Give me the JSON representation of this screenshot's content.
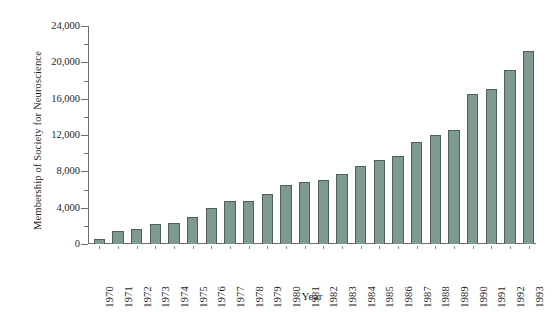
{
  "chart_data": {
    "type": "bar",
    "title": "",
    "xlabel": "Year",
    "ylabel": "Membership of Society for Neuroscience",
    "categories": [
      "1970",
      "1971",
      "1972",
      "1973",
      "1974",
      "1975",
      "1976",
      "1977",
      "1978",
      "1979",
      "1980",
      "1981",
      "1982",
      "1983",
      "1984",
      "1985",
      "1986",
      "1987",
      "1988",
      "1989",
      "1990",
      "1991",
      "1992",
      "1993"
    ],
    "values": [
      500,
      1400,
      1700,
      2200,
      2300,
      3000,
      4000,
      4700,
      4700,
      5500,
      6500,
      6800,
      7000,
      7700,
      8600,
      9300,
      9700,
      11200,
      12000,
      12600,
      16500,
      17100,
      19200,
      21300
    ],
    "ylim": [
      0,
      24000
    ],
    "y_major_ticks": [
      0,
      4000,
      8000,
      12000,
      16000,
      20000,
      24000
    ],
    "y_major_tick_labels": [
      "0",
      "4,000",
      "8,000",
      "12,000",
      "16,000",
      "20,000",
      "24,000"
    ],
    "y_minor_tick_interval": 2000,
    "grid": false,
    "legend": "none",
    "bar_fill_color": "#7e9a90",
    "bar_edge_color": "#4c6159",
    "axis_color": "#6d6d6d",
    "background_color": "#ffffff"
  }
}
